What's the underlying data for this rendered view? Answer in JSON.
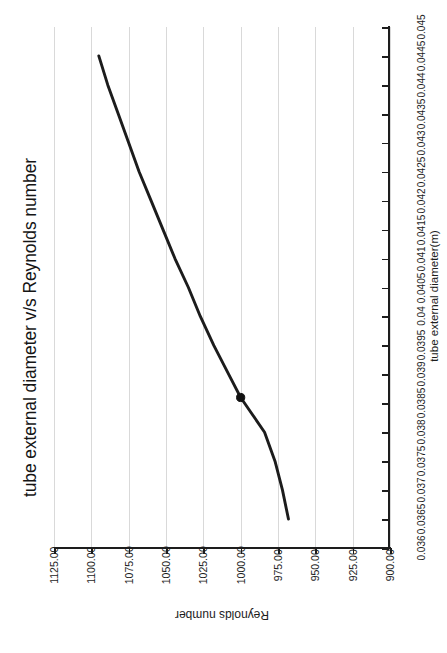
{
  "chart_data": {
    "type": "line",
    "title": "tube external diameter v/s Reynolds number",
    "xlabel": "tube external diameter(m)",
    "ylabel": "Reynolds number",
    "orientation": "rotated-90-ccw",
    "grid": "reynolds-gridlines-only",
    "legend": "none",
    "xlim": [
      0.036,
      0.045
    ],
    "ylim": [
      900.0,
      1125.0
    ],
    "xticks": [
      "0.036",
      "0.0365",
      "0.037",
      "0.0375",
      "0.038",
      "0.0385",
      "0.039",
      "0.0395",
      "0.04",
      "0.0405",
      "0.041",
      "0.0415",
      "0.042",
      "0.0425",
      "0.043",
      "0.0435",
      "0.044",
      "0.0445",
      "0.045"
    ],
    "xtick_values": [
      0.036,
      0.0365,
      0.037,
      0.0375,
      0.038,
      0.0385,
      0.039,
      0.0395,
      0.04,
      0.0405,
      0.041,
      0.0415,
      0.042,
      0.0425,
      0.043,
      0.0435,
      0.044,
      0.0445,
      0.045
    ],
    "yticks": [
      "1125.00",
      "1100.00",
      "1075.00",
      "1050.00",
      "1025.00",
      "1000.00",
      "975.00",
      "950.00",
      "925.00",
      "900.00"
    ],
    "ytick_values": [
      1125.0,
      1100.0,
      1075.0,
      1050.0,
      1025.0,
      1000.0,
      975.0,
      950.0,
      925.0,
      900.0
    ],
    "series": [
      {
        "name": "Reynolds number",
        "color": "#1c1c1c",
        "x": [
          0.0365,
          0.037,
          0.0375,
          0.038,
          0.0386,
          0.039,
          0.0395,
          0.04,
          0.0405,
          0.041,
          0.0415,
          0.042,
          0.0425,
          0.043,
          0.0435,
          0.044,
          0.0445
        ],
        "y": [
          968.0,
          972.0,
          977.0,
          984.0,
          1000.0,
          1008.0,
          1018.0,
          1027.0,
          1035.0,
          1044.0,
          1052.0,
          1060.0,
          1068.0,
          1075.0,
          1082.0,
          1089.0,
          1095.0
        ]
      }
    ],
    "markers": [
      {
        "label": "operating point",
        "x": 0.0386,
        "y": 1000.0
      }
    ]
  },
  "axis": {
    "x_title": "tube external diameter(m)",
    "y_title": "Reynolds number"
  },
  "title": "tube external diameter v/s Reynolds number"
}
